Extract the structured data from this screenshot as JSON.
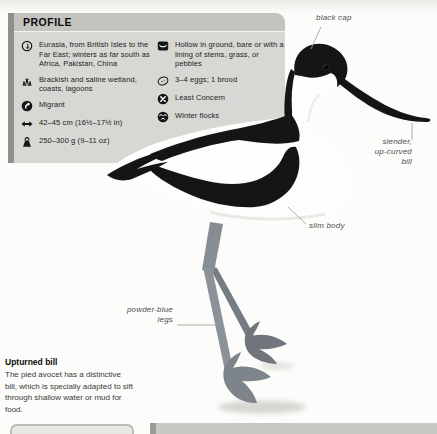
{
  "panel": {
    "title": "PROFILE",
    "left_items": [
      {
        "icon": "distribution-icon",
        "text": "Eurasia, from British Isles to the Far East; winters as far south as Africa, Pakistan, China"
      },
      {
        "icon": "habitat-icon",
        "text": "Brackish and saline wetland, coasts, lagoons"
      },
      {
        "icon": "migration-icon",
        "text": "Migrant"
      },
      {
        "icon": "length-icon",
        "text": "42–45 cm (16½–17½ in)"
      },
      {
        "icon": "weight-icon",
        "text": "250–300 g (9–11 oz)"
      }
    ],
    "right_items": [
      {
        "icon": "nest-icon",
        "text": "Hollow in ground, bare or with a lining of stems, grass, or pebbles"
      },
      {
        "icon": "egg-icon",
        "text": "3–4 eggs; 1 brood"
      },
      {
        "icon": "status-icon",
        "text": "Least Concern"
      },
      {
        "icon": "flock-icon",
        "text": "Winter flocks"
      }
    ]
  },
  "annotations": {
    "black_cap": "black cap",
    "bill_line1": "slender,",
    "bill_line2": "up-curved",
    "bill_line3": "bill",
    "slim_body": "slim body",
    "legs_line1": "powder-blue",
    "legs_line2": "legs"
  },
  "caption": {
    "title": "Upturned bill",
    "body": "The pied avocet has a distinctive bill, which is specially adapted to sift through shallow water or mud for food."
  },
  "colors": {
    "panel_header": "#c3c3bf",
    "panel_body": "#d7d7d3",
    "panel_edge": "#8f8f8b",
    "bird_black": "#151515",
    "leg_blue_gray": "#8b9298"
  }
}
